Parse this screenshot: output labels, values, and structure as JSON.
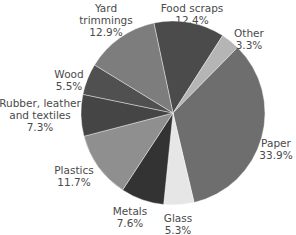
{
  "chart_data": {
    "type": "pie",
    "title": "",
    "start_angle_deg": -12,
    "direction": "clockwise",
    "slices": [
      {
        "label": "Food scraps",
        "value": 12.4,
        "display": "12.4%",
        "color": "#4b4b4b"
      },
      {
        "label": "Other",
        "value": 3.3,
        "display": "3.3%",
        "color": "#b5b5b5"
      },
      {
        "label": "Paper",
        "value": 33.9,
        "display": "33.9%",
        "color": "#6e6e6e"
      },
      {
        "label": "Glass",
        "value": 5.3,
        "display": "5.3%",
        "color": "#e6e6e6"
      },
      {
        "label": "Metals",
        "value": 7.6,
        "display": "7.6%",
        "color": "#333333"
      },
      {
        "label": "Plastics",
        "value": 11.7,
        "display": "11.7%",
        "color": "#8f8f8f"
      },
      {
        "label": "Rubber, leather and textiles",
        "value": 7.3,
        "display": "7.3%",
        "color": "#454545"
      },
      {
        "label": "Wood",
        "value": 5.5,
        "display": "5.5%",
        "color": "#505050"
      },
      {
        "label": "Yard trimmings",
        "value": 12.9,
        "display": "12.9%",
        "color": "#7d7d7d"
      }
    ]
  },
  "labels": {
    "food_scraps": {
      "name": "Food scraps",
      "pct": "12.4%"
    },
    "other": {
      "name": "Other",
      "pct": "3.3%"
    },
    "paper": {
      "name": "Paper",
      "pct": "33.9%"
    },
    "glass": {
      "name": "Glass",
      "pct": "5.3%"
    },
    "metals": {
      "name": "Metals",
      "pct": "7.6%"
    },
    "plastics": {
      "name": "Plastics",
      "pct": "11.7%"
    },
    "rubber": {
      "name1": "Rubber, leather",
      "name2": "and textiles",
      "pct": "7.3%"
    },
    "wood": {
      "name": "Wood",
      "pct": "5.5%"
    },
    "yard": {
      "name1": "Yard",
      "name2": "trimmings",
      "pct": "12.9%"
    }
  }
}
